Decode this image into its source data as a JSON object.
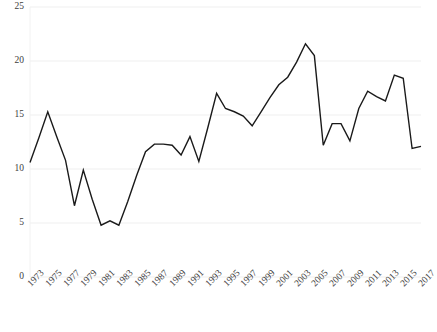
{
  "chart_data": {
    "type": "line",
    "title": "",
    "subtitle": "",
    "xlabel": "",
    "ylabel": "",
    "ylim": [
      0,
      25
    ],
    "yticks": [
      0,
      5,
      10,
      15,
      20,
      25
    ],
    "ytick_labels": [
      "0",
      "5",
      "10",
      "15",
      "20",
      "25"
    ],
    "grid": true,
    "grid_axis": "y",
    "legend": false,
    "legend_position": "none",
    "line_color": "#1a1a1a",
    "grid_color": "#efefef",
    "text_color": "#3d3d3d",
    "background_color": "#ffffff",
    "x": [
      1973,
      1974,
      1975,
      1976,
      1977,
      1978,
      1979,
      1980,
      1981,
      1982,
      1983,
      1984,
      1985,
      1986,
      1987,
      1988,
      1989,
      1990,
      1991,
      1992,
      1993,
      1994,
      1995,
      1996,
      1997,
      1998,
      1999,
      2000,
      2001,
      2002,
      2003,
      2004,
      2005,
      2006,
      2007,
      2008,
      2009,
      2010,
      2011,
      2012,
      2013,
      2014,
      2015,
      2016,
      2017
    ],
    "values": [
      10.6,
      12.9,
      15.3,
      13.0,
      10.8,
      6.6,
      9.9,
      7.2,
      4.8,
      5.2,
      4.8,
      7.0,
      9.4,
      11.6,
      12.3,
      12.3,
      12.2,
      11.3,
      13.0,
      10.7,
      13.8,
      17.0,
      15.6,
      15.3,
      14.9,
      14.0,
      15.3,
      16.6,
      17.8,
      18.5,
      19.9,
      21.6,
      20.5,
      12.2,
      14.2,
      14.2,
      12.6,
      15.6,
      17.2,
      16.7,
      16.3,
      18.7,
      18.4,
      11.9,
      12.1
    ],
    "xtick_labels": [
      "1973",
      "1975",
      "1977",
      "1979",
      "1981",
      "1983",
      "1985",
      "1987",
      "1989",
      "1991",
      "1993",
      "1995",
      "1997",
      "1999",
      "2001",
      "2003",
      "2005",
      "2007",
      "2009",
      "2011",
      "2013",
      "2015",
      "2017"
    ],
    "xtick_values": [
      1973,
      1975,
      1977,
      1979,
      1981,
      1983,
      1985,
      1987,
      1989,
      1991,
      1993,
      1995,
      1997,
      1999,
      2001,
      2003,
      2005,
      2007,
      2009,
      2011,
      2013,
      2015,
      2017
    ],
    "xtick_rotation": -45,
    "series": [
      {
        "name": "",
        "values": [
          10.6,
          12.9,
          15.3,
          13.0,
          10.8,
          6.6,
          9.9,
          7.2,
          4.8,
          5.2,
          4.8,
          7.0,
          9.4,
          11.6,
          12.3,
          12.3,
          12.2,
          11.3,
          13.0,
          10.7,
          13.8,
          17.0,
          15.6,
          15.3,
          14.9,
          14.0,
          15.3,
          16.6,
          17.8,
          18.5,
          19.9,
          21.6,
          20.5,
          12.2,
          14.2,
          14.2,
          12.6,
          15.6,
          17.2,
          16.7,
          16.3,
          18.7,
          18.4,
          11.9,
          12.1
        ]
      }
    ]
  },
  "layout": {
    "plot_left": 30,
    "plot_right": 421,
    "plot_top": 7,
    "plot_bottom": 277
  }
}
